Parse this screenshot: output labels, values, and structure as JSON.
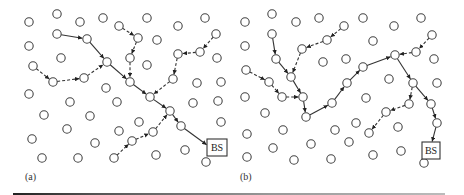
{
  "figure": {
    "arrowhead": "arrow",
    "panels": [
      {
        "label": "(a)",
        "label_pos": [
          25,
          180
        ],
        "bs": {
          "label": "BS",
          "x": 207,
          "y": 139,
          "w": 20,
          "h": 17
        },
        "nodes": [
          [
            29,
            22
          ],
          [
            57,
            14
          ],
          [
            80,
            22
          ],
          [
            103,
            18
          ],
          [
            29,
            46
          ],
          [
            57,
            34
          ],
          [
            87,
            39
          ],
          [
            61,
            58
          ],
          [
            107,
            62
          ],
          [
            33,
            66
          ],
          [
            53,
            82
          ],
          [
            84,
            78
          ],
          [
            29,
            94
          ],
          [
            106,
            88
          ],
          [
            119,
            26
          ],
          [
            147,
            18
          ],
          [
            138,
            38
          ],
          [
            157,
            40
          ],
          [
            130,
            58
          ],
          [
            147,
            65
          ],
          [
            130,
            82
          ],
          [
            178,
            26
          ],
          [
            205,
            18
          ],
          [
            216,
            34
          ],
          [
            178,
            54
          ],
          [
            200,
            52
          ],
          [
            217,
            58
          ],
          [
            173,
            79
          ],
          [
            197,
            83
          ],
          [
            221,
            82
          ],
          [
            150,
            97
          ],
          [
            70,
            102
          ],
          [
            44,
            115
          ],
          [
            90,
            116
          ],
          [
            67,
            129
          ],
          [
            32,
            139
          ],
          [
            95,
            143
          ],
          [
            42,
            158
          ],
          [
            78,
            158
          ],
          [
            114,
            158
          ],
          [
            117,
            102
          ],
          [
            170,
            111
          ],
          [
            193,
            103
          ],
          [
            218,
            101
          ],
          [
            139,
            122
          ],
          [
            119,
            131
          ],
          [
            181,
            126
          ],
          [
            221,
            122
          ],
          [
            153,
            132
          ],
          [
            132,
            141
          ],
          [
            156,
            155
          ],
          [
            185,
            150
          ],
          [
            206,
            162
          ]
        ],
        "solid_paths": [
          [
            [
              57,
              34
            ],
            [
              87,
              39
            ],
            [
              107,
              62
            ],
            [
              130,
              82
            ],
            [
              150,
              97
            ],
            [
              170,
              111
            ],
            [
              181,
              126
            ],
            [
              207,
              145
            ]
          ]
        ],
        "dashed_paths": [
          [
            [
              33,
              66
            ],
            [
              53,
              82
            ],
            [
              84,
              78
            ],
            [
              107,
              62
            ]
          ],
          [
            [
              119,
              26
            ],
            [
              138,
              38
            ],
            [
              130,
              58
            ],
            [
              130,
              82
            ]
          ],
          [
            [
              216,
              34
            ],
            [
              200,
              52
            ],
            [
              178,
              54
            ],
            [
              173,
              79
            ],
            [
              150,
              97
            ]
          ],
          [
            [
              114,
              158
            ],
            [
              132,
              141
            ],
            [
              153,
              132
            ],
            [
              170,
              111
            ]
          ]
        ]
      },
      {
        "label": "(b)",
        "label_pos": [
          240,
          180
        ],
        "bs": {
          "label": "BS",
          "x": 422,
          "y": 142,
          "w": 18,
          "h": 17
        },
        "nodes": [
          [
            245,
            22
          ],
          [
            272,
            14
          ],
          [
            296,
            22
          ],
          [
            319,
            18
          ],
          [
            344,
            26
          ],
          [
            245,
            46
          ],
          [
            272,
            34
          ],
          [
            327,
            40
          ],
          [
            302,
            49
          ],
          [
            276,
            59
          ],
          [
            323,
            62
          ],
          [
            346,
            59
          ],
          [
            246,
            70
          ],
          [
            269,
            82
          ],
          [
            291,
            77
          ],
          [
            347,
            83
          ],
          [
            245,
            97
          ],
          [
            282,
            97
          ],
          [
            303,
            97
          ],
          [
            265,
            113
          ],
          [
            306,
            117
          ],
          [
            332,
            103
          ],
          [
            247,
            134
          ],
          [
            283,
            130
          ],
          [
            335,
            130
          ],
          [
            311,
            144
          ],
          [
            273,
            148
          ],
          [
            247,
            157
          ],
          [
            294,
            160
          ],
          [
            331,
            159
          ],
          [
            363,
            18
          ],
          [
            394,
            26
          ],
          [
            421,
            18
          ],
          [
            373,
            41
          ],
          [
            432,
            35
          ],
          [
            395,
            55
          ],
          [
            416,
            52
          ],
          [
            434,
            59
          ],
          [
            363,
            67
          ],
          [
            389,
            79
          ],
          [
            413,
            83
          ],
          [
            437,
            83
          ],
          [
            366,
            98
          ],
          [
            409,
            104
          ],
          [
            386,
            112
          ],
          [
            431,
            104
          ],
          [
            356,
            123
          ],
          [
            398,
            127
          ],
          [
            437,
            123
          ],
          [
            349,
            142
          ],
          [
            369,
            133
          ],
          [
            373,
            155
          ],
          [
            401,
            151
          ],
          [
            424,
            163
          ]
        ],
        "solid_paths": [
          [
            [
              272,
              34
            ],
            [
              276,
              59
            ],
            [
              291,
              77
            ],
            [
              303,
              97
            ],
            [
              306,
              117
            ],
            [
              332,
              103
            ],
            [
              347,
              83
            ],
            [
              363,
              67
            ],
            [
              395,
              55
            ],
            [
              413,
              83
            ],
            [
              431,
              104
            ],
            [
              437,
              123
            ],
            [
              432,
              142
            ]
          ]
        ],
        "dashed_paths": [
          [
            [
              344,
              26
            ],
            [
              327,
              40
            ],
            [
              302,
              49
            ],
            [
              291,
              77
            ]
          ],
          [
            [
              246,
              70
            ],
            [
              269,
              82
            ],
            [
              282,
              97
            ],
            [
              303,
              97
            ]
          ],
          [
            [
              432,
              35
            ],
            [
              416,
              52
            ],
            [
              395,
              55
            ]
          ],
          [
            [
              413,
              83
            ],
            [
              409,
              104
            ],
            [
              386,
              112
            ],
            [
              369,
              133
            ]
          ]
        ]
      }
    ]
  }
}
